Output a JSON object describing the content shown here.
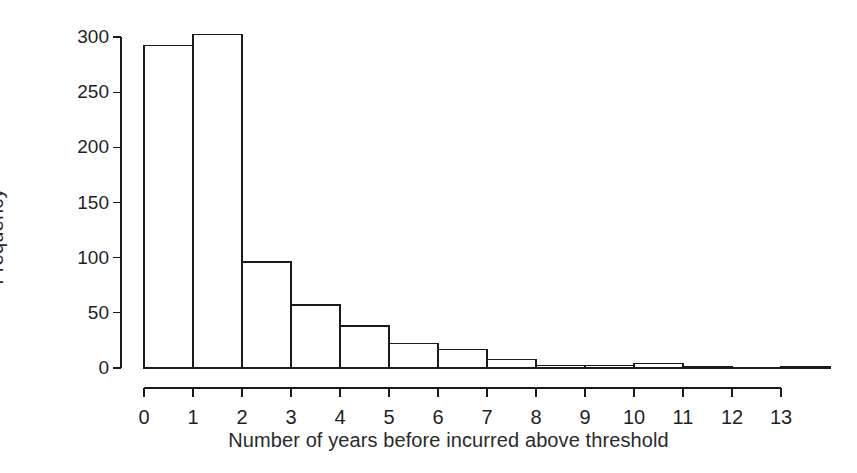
{
  "chart_data": {
    "type": "bar",
    "title": "",
    "subtitle": "",
    "xlabel": "Number of years before incurred above threshold",
    "ylabel": "Frequency",
    "categories": [
      "0",
      "1",
      "2",
      "3",
      "4",
      "5",
      "6",
      "7",
      "8",
      "9",
      "10",
      "11",
      "12",
      "13"
    ],
    "values": [
      292,
      302,
      96,
      57,
      38,
      22,
      17,
      8,
      2,
      2,
      4,
      1,
      0,
      1
    ],
    "xlim": [
      -0.5,
      13.5
    ],
    "ylim": [
      0,
      310
    ],
    "x_ticks": [
      "0",
      "1",
      "2",
      "3",
      "4",
      "5",
      "6",
      "7",
      "8",
      "9",
      "10",
      "11",
      "12",
      "13"
    ],
    "y_ticks": [
      "0",
      "50",
      "100",
      "150",
      "200",
      "250",
      "300"
    ],
    "y_tick_values": [
      0,
      50,
      100,
      150,
      200,
      250,
      300
    ],
    "grid": false,
    "legend": null,
    "bar_fill_color": "#ffffff",
    "bar_edge_color": "#1a1a1a",
    "axis_color": "#1a1a1a",
    "background_color": "#ffffff"
  },
  "axes": {
    "y_axis_name": "Frequency",
    "x_axis_name": "Number of years before incurred above threshold"
  }
}
